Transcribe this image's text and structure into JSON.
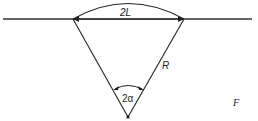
{
  "figure": {
    "labels": {
      "chord": "2L",
      "radius": "R",
      "angle": "2α"
    },
    "caption_fragments": [
      "F",
      "of",
      "(A",
      "B"
    ]
  }
}
